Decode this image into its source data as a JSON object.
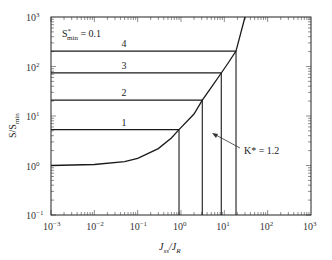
{
  "chart_data": {
    "type": "line",
    "title": "",
    "xlabel": "J_ss / J_R",
    "ylabel": "S / S_min",
    "xscale": "log",
    "yscale": "log",
    "xlim": [
      0.001,
      1000
    ],
    "ylim": [
      0.1,
      1000
    ],
    "grid": false,
    "x_ticks": [
      "10^-3",
      "10^-2",
      "10^-1",
      "10^0",
      "10^1",
      "10^2",
      "10^3"
    ],
    "y_ticks": [
      "10^-1",
      "10^0",
      "10^1",
      "10^2",
      "10^3"
    ],
    "annotations": [
      {
        "text": "S*min = 0.1",
        "position": "top-left"
      },
      {
        "text": "K* = 1.2",
        "arrow_to": "curve",
        "x": 10,
        "y": 14
      }
    ],
    "curve": {
      "name": "K* = 1.2",
      "x": [
        0.001,
        0.01,
        0.05,
        0.1,
        0.3,
        0.6,
        0.9,
        2,
        3.1,
        5,
        8.5,
        12,
        18.6,
        30
      ],
      "y": [
        1.0,
        1.05,
        1.2,
        1.4,
        2.2,
        3.6,
        5.3,
        11,
        21,
        38,
        74,
        115,
        205,
        1000
      ]
    },
    "series": [
      {
        "name": "1",
        "level_y": 5.3,
        "x_intersect": 0.9
      },
      {
        "name": "2",
        "level_y": 21,
        "x_intersect": 3.1
      },
      {
        "name": "3",
        "level_y": 74,
        "x_intersect": 8.5
      },
      {
        "name": "4",
        "level_y": 205,
        "x_intersect": 18.6
      }
    ]
  },
  "labels": {
    "x_axis": "J",
    "x_axis_sub1": "ss",
    "x_axis_mid": "/J",
    "x_axis_sub2": "R",
    "y_axis": "S/S",
    "y_axis_sub": "min",
    "smin_prefix": "S",
    "smin_sup": "*",
    "smin_sub": "min",
    "smin_value": " = 0.1",
    "k_label": "K* = 1.2",
    "line_labels": [
      "1",
      "2",
      "3",
      "4"
    ],
    "x_tick_base": "10",
    "x_tick_exps": [
      "−3",
      "−2",
      "−1",
      "0",
      "1",
      "2",
      "3"
    ],
    "y_tick_exps": [
      "−1",
      "0",
      "1",
      "2",
      "3"
    ]
  }
}
